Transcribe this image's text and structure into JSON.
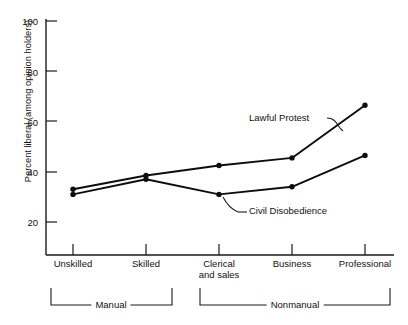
{
  "chart_data": {
    "type": "line",
    "title": "",
    "xlabel": "",
    "ylabel": "Percent liberal (among opinion holders)",
    "categories": [
      "Unskilled",
      "Skilled",
      "Clerical and sales",
      "Business",
      "Professional"
    ],
    "category_lines": [
      [
        "Unskilled"
      ],
      [
        "Skilled"
      ],
      [
        "Clerical",
        "and sales"
      ],
      [
        "Business"
      ],
      [
        "Professional"
      ]
    ],
    "series": [
      {
        "name": "Lawful Protest",
        "values": [
          33,
          38.5,
          42.5,
          45.5,
          66.5
        ]
      },
      {
        "name": "Civil Disobedience",
        "values": [
          31,
          37,
          31,
          34,
          46.5
        ]
      }
    ],
    "ylim": [
      20,
      100
    ],
    "yticks": [
      20,
      40,
      60,
      80,
      100
    ],
    "ytick_labels": [
      "20",
      "40",
      "60",
      "80",
      "100"
    ],
    "grid": false,
    "legend": "annotations-inline",
    "annotations": [
      {
        "name": "Lawful Protest",
        "text": "Lawful Protest"
      },
      {
        "name": "Civil Disobedience",
        "text": "Civil Disobedience"
      }
    ],
    "groups": [
      {
        "label": "Manual",
        "categories": [
          "Unskilled",
          "Skilled"
        ]
      },
      {
        "label": "Nonmanual",
        "categories": [
          "Clerical and sales",
          "Business",
          "Professional"
        ]
      }
    ],
    "line_color": "#0d0d0d",
    "axis_color": "#1a1a1a",
    "background": "#ffffff"
  },
  "ytick_labels": {
    "t0": "20",
    "t1": "40",
    "t2": "60",
    "t3": "80",
    "t4": "100"
  },
  "xtick_labels": {
    "c0": "Unskilled",
    "c1": "Skilled",
    "c2a": "Clerical",
    "c2b": "and sales",
    "c3": "Business",
    "c4": "Professional"
  },
  "annotations": {
    "lawful": "Lawful Protest",
    "civil": "Civil Disobedience"
  },
  "groups": {
    "manual": "Manual",
    "nonmanual": "Nonmanual"
  },
  "axis": {
    "ylabel": "Percent liberal (among opinion holders)"
  }
}
